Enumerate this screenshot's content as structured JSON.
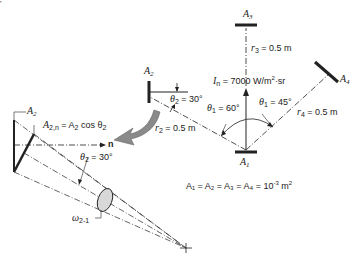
{
  "figure": {
    "corner_mark": "'",
    "surfaces": {
      "A1": {
        "label": "A",
        "sub": "1"
      },
      "A2": {
        "label": "A",
        "sub": "2"
      },
      "A3": {
        "label": "A",
        "sub": "3"
      },
      "A4": {
        "label": "A",
        "sub": "4"
      }
    },
    "intensity": {
      "symbol": "I",
      "sub": "n",
      "value": " = 7000 W/m",
      "sup": "2",
      "unit_tail": "·sr"
    },
    "distances": {
      "r2": {
        "symbol": "r",
        "sub": "2",
        "value": " = 0.5 m"
      },
      "r3": {
        "symbol": "r",
        "sub": "3",
        "value": " = 0.5 m"
      },
      "r4": {
        "symbol": "r",
        "sub": "4",
        "value": " = 0.5 m"
      }
    },
    "angles": {
      "theta1_left": {
        "symbol": "θ",
        "sub": "1",
        "value": " = 60°"
      },
      "theta1_right": {
        "symbol": "θ",
        "sub": "1",
        "value": " = 45°"
      },
      "theta2_top": {
        "symbol": "θ",
        "sub": "2",
        "value": " = 30°"
      },
      "theta2_detail": {
        "symbol": "θ",
        "sub": "2",
        "value": " = 30°"
      }
    },
    "area_equation": {
      "text": "A₁ = A₂ = A₃ = A₄ = 10",
      "sup": "-3",
      "tail": " m",
      "tail_sup": "2"
    },
    "detail": {
      "A2_label": {
        "label": "A",
        "sub": "2"
      },
      "projected_area": {
        "symbol": "A",
        "sub": "2,n",
        "value": " = A",
        "sub2": "2",
        "tail": " cos θ",
        "sub3": "2"
      },
      "normal_label": "n",
      "solid_angle": {
        "symbol": "ω",
        "sub": "2-1"
      }
    },
    "colors": {
      "line": "#222222",
      "arrow_fill": "#8a8a8a",
      "ellipse_fill": "#d8d8d8"
    }
  }
}
